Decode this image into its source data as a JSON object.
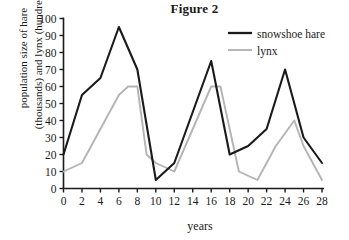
{
  "figure": {
    "title": "Figure 2",
    "xlabel": "years",
    "ylabel_line1": "population size of hare",
    "ylabel_line2": "(thousands) and lynx (hundreds)"
  },
  "legend": {
    "position": "top-right",
    "entries": [
      {
        "label": "snowshoe hare",
        "color": "#1a1a1a"
      },
      {
        "label": "lynx",
        "color": "#b4b4b4"
      }
    ]
  },
  "axis": {
    "x_ticks": [
      "0",
      "2",
      "4",
      "6",
      "8",
      "10",
      "12",
      "14",
      "16",
      "18",
      "20",
      "22",
      "24",
      "26",
      "28"
    ],
    "y_ticks": [
      "0",
      "10",
      "20",
      "30",
      "40",
      "50",
      "60",
      "70",
      "80",
      "90",
      "100"
    ]
  },
  "chart_data": {
    "type": "line",
    "title": "Figure 2",
    "xlabel": "years",
    "ylabel": "population size of hare (thousands) and lynx (hundreds)",
    "xlim": [
      0,
      28
    ],
    "ylim": [
      0,
      100
    ],
    "xticks": [
      0,
      2,
      4,
      6,
      8,
      10,
      12,
      14,
      16,
      18,
      20,
      22,
      24,
      26,
      28
    ],
    "yticks": [
      0,
      10,
      20,
      30,
      40,
      50,
      60,
      70,
      80,
      90,
      100
    ],
    "grid": false,
    "legend_position": "top-right",
    "series": [
      {
        "name": "snowshoe hare",
        "color": "#1a1a1a",
        "points": [
          [
            0,
            20
          ],
          [
            2,
            55
          ],
          [
            4,
            65
          ],
          [
            6,
            95
          ],
          [
            8,
            70
          ],
          [
            10,
            5
          ],
          [
            12,
            15
          ],
          [
            16,
            75
          ],
          [
            18,
            20
          ],
          [
            20,
            25
          ],
          [
            22,
            35
          ],
          [
            24,
            70
          ],
          [
            26,
            30
          ],
          [
            28,
            15
          ]
        ]
      },
      {
        "name": "lynx",
        "color": "#b4b4b4",
        "points": [
          [
            0,
            10
          ],
          [
            2,
            15
          ],
          [
            6,
            55
          ],
          [
            7,
            60
          ],
          [
            8,
            60
          ],
          [
            9,
            20
          ],
          [
            10,
            15
          ],
          [
            12,
            10
          ],
          [
            16,
            60
          ],
          [
            17,
            60
          ],
          [
            18,
            35
          ],
          [
            19,
            10
          ],
          [
            21,
            5
          ],
          [
            23,
            25
          ],
          [
            25,
            40
          ],
          [
            26,
            25
          ],
          [
            28,
            5
          ]
        ]
      }
    ]
  }
}
